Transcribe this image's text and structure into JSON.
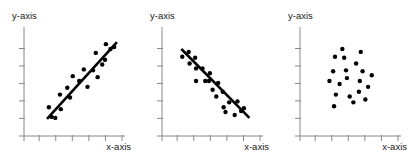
{
  "figure": {
    "width": 414,
    "height": 163,
    "background": "#ffffff",
    "point_color": "#000000",
    "line_color": "#000000",
    "axis_color": "#888888",
    "label_color": "#1a1a1a",
    "point_radius": 2.2,
    "line_width": 2.6,
    "axis_width": 1
  },
  "chart_data": [
    {
      "type": "scatter",
      "title": "",
      "correlation": "positive",
      "xlabel": "x-axis",
      "ylabel": "y-axis",
      "xlim": [
        0,
        10
      ],
      "ylim": [
        0,
        10
      ],
      "grid": false,
      "legend": "none",
      "xticks": [
        1,
        2.8,
        4.6,
        6.4,
        8.2,
        10
      ],
      "yticks": [
        1.2,
        3.0,
        4.8,
        6.6,
        8.4
      ],
      "points": [
        {
          "x": 2.05,
          "y": 2.35
        },
        {
          "x": 2.35,
          "y": 1.35
        },
        {
          "x": 2.75,
          "y": 1.25
        },
        {
          "x": 3.25,
          "y": 3.65
        },
        {
          "x": 3.35,
          "y": 2.15
        },
        {
          "x": 4.05,
          "y": 4.35
        },
        {
          "x": 4.35,
          "y": 3.35
        },
        {
          "x": 4.65,
          "y": 5.55
        },
        {
          "x": 5.35,
          "y": 5.05
        },
        {
          "x": 5.85,
          "y": 6.25
        },
        {
          "x": 6.25,
          "y": 4.45
        },
        {
          "x": 6.85,
          "y": 6.15
        },
        {
          "x": 7.15,
          "y": 7.95
        },
        {
          "x": 7.35,
          "y": 5.45
        },
        {
          "x": 7.85,
          "y": 6.75
        },
        {
          "x": 8.15,
          "y": 7.25
        },
        {
          "x": 8.25,
          "y": 8.85
        },
        {
          "x": 8.75,
          "y": 8.35
        },
        {
          "x": 9.15,
          "y": 8.55
        }
      ],
      "trendline": {
        "x1": 1.85,
        "y1": 1.15,
        "x2": 9.45,
        "y2": 9.05
      }
    },
    {
      "type": "scatter",
      "title": "",
      "correlation": "negative",
      "xlabel": "x-axis",
      "ylabel": "y-axis",
      "xlim": [
        0,
        10
      ],
      "ylim": [
        0,
        10
      ],
      "grid": false,
      "legend": "none",
      "xticks": [
        1,
        2.8,
        4.6,
        6.4,
        8.2,
        10
      ],
      "yticks": [
        1.2,
        3.0,
        4.8,
        6.6,
        8.4
      ],
      "points": [
        {
          "x": 1.55,
          "y": 7.55
        },
        {
          "x": 2.25,
          "y": 8.05
        },
        {
          "x": 2.35,
          "y": 6.85
        },
        {
          "x": 2.95,
          "y": 7.45
        },
        {
          "x": 3.05,
          "y": 6.35
        },
        {
          "x": 3.05,
          "y": 5.05
        },
        {
          "x": 3.75,
          "y": 6.35
        },
        {
          "x": 4.05,
          "y": 5.05
        },
        {
          "x": 4.45,
          "y": 5.05
        },
        {
          "x": 4.55,
          "y": 5.85
        },
        {
          "x": 4.85,
          "y": 4.15
        },
        {
          "x": 5.25,
          "y": 3.45
        },
        {
          "x": 5.45,
          "y": 4.85
        },
        {
          "x": 5.95,
          "y": 3.95
        },
        {
          "x": 6.05,
          "y": 2.35
        },
        {
          "x": 6.25,
          "y": 1.85
        },
        {
          "x": 6.65,
          "y": 2.85
        },
        {
          "x": 7.25,
          "y": 1.55
        },
        {
          "x": 7.55,
          "y": 2.95
        },
        {
          "x": 7.95,
          "y": 1.95
        },
        {
          "x": 8.25,
          "y": 2.25
        }
      ],
      "trendline": {
        "x1": 1.45,
        "y1": 8.35,
        "x2": 8.85,
        "y2": 1.25
      }
    },
    {
      "type": "scatter",
      "title": "",
      "correlation": "none",
      "xlabel": "x-axis",
      "ylabel": "y-axis",
      "xlim": [
        0,
        10
      ],
      "ylim": [
        0,
        10
      ],
      "grid": false,
      "legend": "none",
      "xticks": [
        1,
        2.8,
        4.6,
        6.4,
        8.2,
        10
      ],
      "yticks": [
        1.2,
        3.0,
        4.8,
        6.6,
        8.4
      ],
      "points": [
        {
          "x": 3.15,
          "y": 7.55
        },
        {
          "x": 3.95,
          "y": 8.35
        },
        {
          "x": 4.15,
          "y": 7.45
        },
        {
          "x": 5.95,
          "y": 8.05
        },
        {
          "x": 2.95,
          "y": 6.05
        },
        {
          "x": 4.35,
          "y": 6.15
        },
        {
          "x": 5.45,
          "y": 6.85
        },
        {
          "x": 6.15,
          "y": 6.05
        },
        {
          "x": 7.15,
          "y": 5.65
        },
        {
          "x": 2.55,
          "y": 5.05
        },
        {
          "x": 3.65,
          "y": 4.75
        },
        {
          "x": 4.45,
          "y": 5.35
        },
        {
          "x": 5.85,
          "y": 5.05
        },
        {
          "x": 6.75,
          "y": 4.45
        },
        {
          "x": 3.25,
          "y": 3.65
        },
        {
          "x": 4.75,
          "y": 3.45
        },
        {
          "x": 5.75,
          "y": 3.95
        },
        {
          "x": 6.45,
          "y": 3.15
        },
        {
          "x": 3.05,
          "y": 2.45
        },
        {
          "x": 5.15,
          "y": 2.85
        }
      ],
      "trendline": null
    }
  ],
  "panels": [
    {
      "id": "panel-positive",
      "name": "scatter-plot-positive-correlation",
      "offset_x": 0,
      "xlabel": "x-axis",
      "ylabel": "y-axis"
    },
    {
      "id": "panel-negative",
      "name": "scatter-plot-negative-correlation",
      "offset_x": 138,
      "xlabel": "x-axis",
      "ylabel": "y-axis"
    },
    {
      "id": "panel-none",
      "name": "scatter-plot-no-correlation",
      "offset_x": 276,
      "xlabel": "x-axis",
      "ylabel": "y-axis"
    }
  ]
}
